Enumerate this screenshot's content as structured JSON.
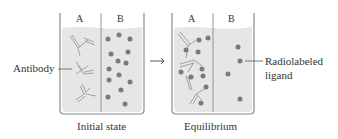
{
  "figure": {
    "beakers": [
      {
        "id": "initial",
        "compartment_labels": [
          "A",
          "B"
        ],
        "caption": "Initial state"
      },
      {
        "id": "equilibrium",
        "compartment_labels": [
          "A",
          "B"
        ],
        "caption": "Equilibrium"
      }
    ],
    "callouts": {
      "antibody": "Antibody",
      "ligand_line1": "Radiolabeled",
      "ligand_line2": "ligand"
    },
    "arrow": "→",
    "colors": {
      "liquid": "#e6e6e6",
      "outline": "#8a8a8a",
      "ligand": "#7a7a7a",
      "antibody": "#9a9a9a",
      "text": "#333333"
    }
  }
}
